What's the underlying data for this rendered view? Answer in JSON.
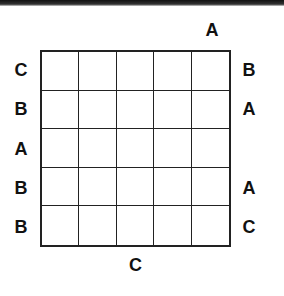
{
  "puzzle": {
    "type": "letter-placement-grid",
    "rows": 5,
    "cols": 5,
    "clues": {
      "top": [
        "",
        "",
        "",
        "",
        "A"
      ],
      "bottom": [
        "",
        "",
        "C",
        "",
        ""
      ],
      "left": [
        "C",
        "B",
        "A",
        "B",
        "B"
      ],
      "right": [
        "B",
        "A",
        "",
        "A",
        "C"
      ]
    },
    "cells": [
      [
        "",
        "",
        "",
        "",
        ""
      ],
      [
        "",
        "",
        "",
        "",
        ""
      ],
      [
        "",
        "",
        "",
        "",
        ""
      ],
      [
        "",
        "",
        "",
        "",
        ""
      ],
      [
        "",
        "",
        "",
        "",
        ""
      ]
    ]
  },
  "colors": {
    "grid_line": "#222222",
    "clue_text": "#111111",
    "background": "#ffffff"
  }
}
